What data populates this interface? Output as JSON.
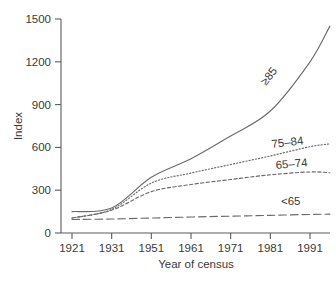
{
  "chart_data": {
    "type": "line",
    "title": "",
    "xlabel": "Year of census",
    "ylabel": "Index",
    "grid": false,
    "legend_position": "inline-right-labels",
    "x": [
      1921,
      1931,
      1951,
      1961,
      1971,
      1981,
      1991,
      1996
    ],
    "x_tick_labels": [
      "1921",
      "1931",
      "1951",
      "1961",
      "1971",
      "1981",
      "1991"
    ],
    "x_ticks": [
      1921,
      1931,
      1951,
      1961,
      1971,
      1981,
      1991
    ],
    "y_tick_labels": [
      "0",
      "300",
      "600",
      "900",
      "1200",
      "1500"
    ],
    "y_ticks": [
      0,
      300,
      600,
      900,
      1200,
      1500
    ],
    "ylim": [
      0,
      1500
    ],
    "note_x_axis": "decades plotted at equal spacing; 1941 census omitted",
    "series": [
      {
        "name": "≥85",
        "label": "≥85",
        "style": "solid",
        "values": [
          150,
          175,
          390,
          520,
          680,
          855,
          1200,
          1450
        ]
      },
      {
        "name": "75–84",
        "label": "75–84",
        "style": "dotted",
        "values": [
          105,
          165,
          350,
          420,
          480,
          540,
          605,
          625
        ]
      },
      {
        "name": "65–74",
        "label": "65–74",
        "style": "dashed-short",
        "values": [
          105,
          160,
          290,
          340,
          375,
          408,
          428,
          422
        ]
      },
      {
        "name": "<65",
        "label": "<65",
        "style": "dashed-long",
        "values": [
          95,
          98,
          105,
          112,
          118,
          124,
          130,
          132
        ]
      }
    ]
  },
  "colors": {
    "line": "#6b6b6b",
    "axis": "#5a5a5a",
    "text": "#3a3a3a",
    "background": "#ffffff"
  },
  "labels": {
    "series_ge85": "≥85",
    "series_75_84": "75–84",
    "series_65_74": "65–74",
    "series_lt65": "<65",
    "x_axis_title": "Year of census",
    "y_axis_title": "Index"
  }
}
